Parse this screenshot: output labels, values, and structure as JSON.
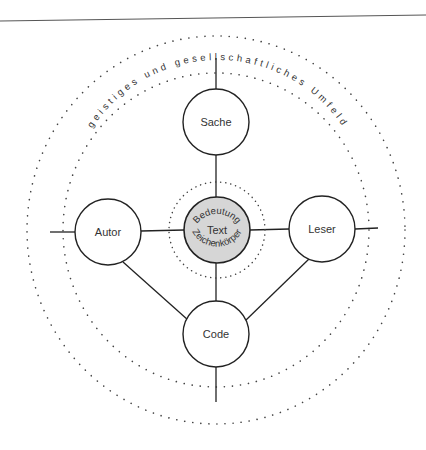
{
  "diagram": {
    "environment_label": "geistiges und gesellschaftliches Umfeld",
    "center": {
      "label": "Text",
      "top_arc_label": "Bedeutung",
      "bottom_arc_label": "Zeichenkörper",
      "fill": "#d6d6d6"
    },
    "nodes": [
      {
        "id": "sache",
        "label": "Sache"
      },
      {
        "id": "autor",
        "label": "Autor"
      },
      {
        "id": "leser",
        "label": "Leser"
      },
      {
        "id": "code",
        "label": "Code"
      }
    ],
    "colors": {
      "stroke": "#222222",
      "dots": "#444444",
      "background": "#ffffff"
    }
  }
}
